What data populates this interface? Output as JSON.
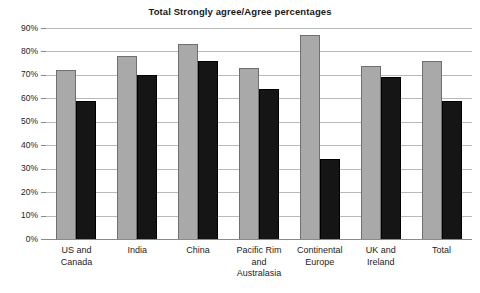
{
  "chart_data": {
    "type": "bar",
    "title": "Total Strongly agree/Agree percentages",
    "xlabel": "",
    "ylabel": "",
    "ylim": [
      0,
      90
    ],
    "ytick_labels": [
      "0%",
      "10%",
      "20%",
      "30%",
      "40%",
      "50%",
      "60%",
      "70%",
      "80%",
      "90%"
    ],
    "ytick_values": [
      0,
      10,
      20,
      30,
      40,
      50,
      60,
      70,
      80,
      90
    ],
    "grid": true,
    "legend": "none",
    "categories": [
      "US and Canada",
      "India",
      "China",
      "Pacific Rim and Australasia",
      "Continental Europe",
      "UK and Ireland",
      "Total"
    ],
    "series": [
      {
        "name": "Series 1",
        "color": "#a9a9a9",
        "values": [
          72,
          78,
          83,
          73,
          87,
          74,
          76
        ]
      },
      {
        "name": "Series 2",
        "color": "#151515",
        "values": [
          59,
          70,
          76,
          64,
          34,
          69,
          59
        ]
      }
    ]
  },
  "axis": {
    "tick_0": "0%",
    "tick_10": "10%",
    "tick_20": "20%",
    "tick_30": "30%",
    "tick_40": "40%",
    "tick_50": "50%",
    "tick_60": "60%",
    "tick_70": "70%",
    "tick_80": "80%",
    "tick_90": "90%"
  },
  "category_labels": {
    "c0_line1": "US and",
    "c0_line2": "Canada",
    "c1_line1": "India",
    "c2_line1": "China",
    "c3_line1": "Pacific Rim",
    "c3_line2": "and",
    "c3_line3": "Australasia",
    "c4_line1": "Continental",
    "c4_line2": "Europe",
    "c5_line1": "UK and",
    "c5_line2": "Ireland",
    "c6_line1": "Total"
  }
}
